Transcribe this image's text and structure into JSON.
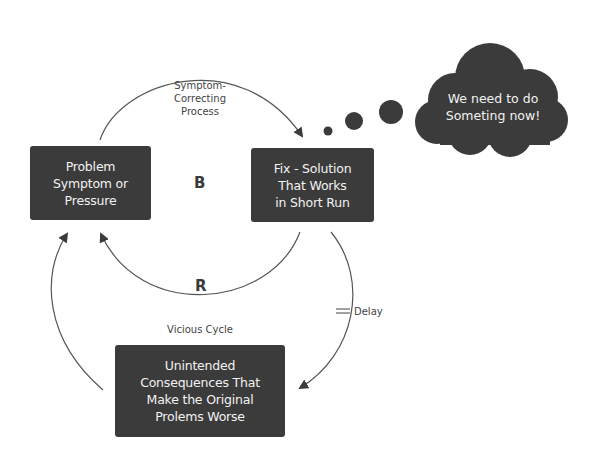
{
  "diagram": {
    "colors": {
      "box_fill": "#3b3b3b",
      "box_text": "#f2f2f2",
      "line": "#555555",
      "label": "#444444",
      "background": "#ffffff"
    },
    "nodes": {
      "problem": {
        "lines": [
          "Problem",
          "Symptom or",
          "Pressure"
        ]
      },
      "fix": {
        "lines": [
          "Fix - Solution",
          "That Works",
          "in Short Run"
        ]
      },
      "consequences": {
        "lines": [
          "Unintended",
          "Consequences That",
          "Make the Original",
          "Prolems Worse"
        ]
      }
    },
    "labels": {
      "symptom_correcting": [
        "Symptom-",
        "Correcting",
        "Process"
      ],
      "balancing_loop": "B",
      "reinforcing_loop": "R",
      "vicious_cycle": "Vicious Cycle",
      "delay": "Delay"
    },
    "thought_cloud": {
      "lines": [
        "We need to do",
        "Someting now!"
      ],
      "bubbles": 3
    },
    "edges": [
      {
        "from": "problem",
        "to": "fix",
        "label": "Symptom-Correcting Process",
        "loop": "B"
      },
      {
        "from": "fix",
        "to": "problem",
        "loop": "R"
      },
      {
        "from": "fix",
        "to": "consequences",
        "label": "Delay"
      },
      {
        "from": "consequences",
        "to": "problem",
        "label": "Vicious Cycle"
      }
    ]
  }
}
